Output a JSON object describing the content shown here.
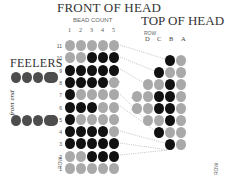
{
  "titles": {
    "front": "FRONT OF HEAD",
    "top": "TOP OF HEAD",
    "bead_count": "BEAD COUNT",
    "row_top": "ROW",
    "row_front": "ROW",
    "row_bottom_right": "ROW",
    "feelers": "FEELERS",
    "front_end": "front end"
  },
  "colors": {
    "gray": "#a9a9a9",
    "black": "#111111",
    "feeler": "#4d4d4d"
  },
  "front_columns": [
    "1",
    "2",
    "3",
    "4",
    "5"
  ],
  "top_columns": [
    "D",
    "C",
    "B",
    "A"
  ],
  "front_rows": [
    {
      "row": "11",
      "beads": "GGGGG"
    },
    {
      "row": "10",
      "beads": "GGBBB"
    },
    {
      "row": "9",
      "beads": "BBBBB"
    },
    {
      "row": "8",
      "beads": "BBBBG"
    },
    {
      "row": "7",
      "beads": "BGGGG"
    },
    {
      "row": "6",
      "beads": "BBBGG"
    },
    {
      "row": "5",
      "beads": "BGGGG"
    },
    {
      "row": "4",
      "beads": "BBBBG"
    },
    {
      "row": "3",
      "beads": "BBBBB"
    },
    {
      "row": "2",
      "beads": "GGBBB"
    },
    {
      "row": "1",
      "beads": "GGGGG"
    }
  ],
  "top_rows": [
    {
      "y": 60,
      "beads": [
        [
          170,
          "B"
        ],
        [
          181,
          "G"
        ]
      ]
    },
    {
      "y": 72,
      "beads": [
        [
          159,
          "B"
        ],
        [
          170,
          "G"
        ],
        [
          181,
          "G"
        ]
      ]
    },
    {
      "y": 84,
      "beads": [
        [
          148,
          "G"
        ],
        [
          159,
          "G"
        ],
        [
          170,
          "B"
        ],
        [
          181,
          "G"
        ]
      ]
    },
    {
      "y": 96,
      "beads": [
        [
          137,
          "G"
        ],
        [
          148,
          "G"
        ],
        [
          159,
          "B"
        ],
        [
          170,
          "B"
        ],
        [
          181,
          "G"
        ]
      ]
    },
    {
      "y": 108,
      "beads": [
        [
          137,
          "G"
        ],
        [
          148,
          "G"
        ],
        [
          159,
          "B"
        ],
        [
          170,
          "B"
        ],
        [
          181,
          "G"
        ]
      ]
    },
    {
      "y": 120,
      "beads": [
        [
          148,
          "G"
        ],
        [
          159,
          "G"
        ],
        [
          170,
          "B"
        ],
        [
          181,
          "G"
        ]
      ]
    },
    {
      "y": 132,
      "beads": [
        [
          159,
          "B"
        ],
        [
          170,
          "G"
        ],
        [
          181,
          "G"
        ]
      ]
    },
    {
      "y": 144,
      "beads": [
        [
          170,
          "B"
        ],
        [
          181,
          "G"
        ]
      ]
    }
  ],
  "feelers": {
    "rows": 2,
    "round_beads_per_row": 3,
    "long_beads_per_row": 1
  }
}
